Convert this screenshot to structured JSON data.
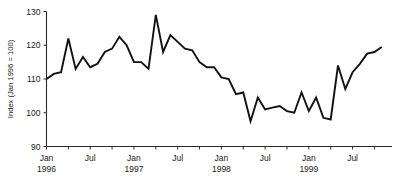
{
  "chart_data": {
    "type": "line",
    "title": "",
    "subtitle": "",
    "xlabel": "",
    "ylabel": "Index (Jan 1996 = 100)",
    "ylim": [
      90,
      130
    ],
    "ytick_values": [
      90,
      100,
      110,
      120,
      130
    ],
    "ytick_labels": [
      "90",
      "100",
      "110",
      "120",
      "130"
    ],
    "grid": false,
    "legend": null,
    "legend_position": "none",
    "x_axis_type": "monthly-time-series",
    "x_range": [
      "1996-01",
      "1999-11"
    ],
    "xtick_labels": [
      {
        "month": "Jan",
        "year": "1996"
      },
      {
        "month": "Jul",
        "year": ""
      },
      {
        "month": "Jan",
        "year": "1997"
      },
      {
        "month": "Jul",
        "year": ""
      },
      {
        "month": "Jan",
        "year": "1998"
      },
      {
        "month": "Jul",
        "year": ""
      },
      {
        "month": "Jan",
        "year": "1999"
      },
      {
        "month": "Jul",
        "year": ""
      }
    ],
    "minor_tick_interval_months": 3,
    "x": [
      "1996-01",
      "1996-02",
      "1996-03",
      "1996-04",
      "1996-05",
      "1996-06",
      "1996-07",
      "1996-08",
      "1996-09",
      "1996-10",
      "1996-11",
      "1996-12",
      "1997-01",
      "1997-02",
      "1997-03",
      "1997-04",
      "1997-05",
      "1997-06",
      "1997-07",
      "1997-08",
      "1997-09",
      "1997-10",
      "1997-11",
      "1997-12",
      "1998-01",
      "1998-02",
      "1998-03",
      "1998-04",
      "1998-05",
      "1998-06",
      "1998-07",
      "1998-08",
      "1998-09",
      "1998-10",
      "1998-11",
      "1998-12",
      "1999-01",
      "1999-02",
      "1999-03",
      "1999-04",
      "1999-05",
      "1999-06",
      "1999-07",
      "1999-08",
      "1999-09",
      "1999-10",
      "1999-11"
    ],
    "values": [
      110.0,
      111.5,
      112.0,
      122.0,
      113.0,
      116.5,
      113.5,
      114.5,
      118.0,
      119.0,
      122.5,
      120.0,
      115.0,
      115.0,
      113.0,
      129.0,
      118.0,
      123.0,
      121.0,
      119.0,
      118.5,
      115.0,
      113.5,
      113.5,
      110.5,
      110.0,
      105.5,
      106.0,
      97.5,
      104.5,
      101.0,
      101.5,
      102.0,
      100.5,
      100.0,
      106.0,
      100.5,
      104.5,
      98.5,
      98.0,
      114.0,
      107.0,
      112.0,
      114.5,
      117.5,
      118.0,
      119.5
    ],
    "series": [
      {
        "name": "Index (Jan 1996 = 100)",
        "color": "#111111",
        "values": [
          110.0,
          111.5,
          112.0,
          122.0,
          113.0,
          116.5,
          113.5,
          114.5,
          118.0,
          119.0,
          122.5,
          120.0,
          115.0,
          115.0,
          113.0,
          129.0,
          118.0,
          123.0,
          121.0,
          119.0,
          118.5,
          115.0,
          113.5,
          113.5,
          110.5,
          110.0,
          105.5,
          106.0,
          97.5,
          104.5,
          101.0,
          101.5,
          102.0,
          100.5,
          100.0,
          106.0,
          100.5,
          104.5,
          98.5,
          98.0,
          114.0,
          107.0,
          112.0,
          114.5,
          117.5,
          118.0,
          119.5
        ]
      }
    ],
    "annotations": []
  },
  "axes": {
    "y_title": "Index (Jan 1996 = 100)",
    "y_ticks": [
      "130",
      "120",
      "110",
      "100",
      "90"
    ],
    "x_ticks": [
      {
        "top": "Jan",
        "bottom": "1996"
      },
      {
        "top": "Jul",
        "bottom": ""
      },
      {
        "top": "Jan",
        "bottom": "1997"
      },
      {
        "top": "Jul",
        "bottom": ""
      },
      {
        "top": "Jan",
        "bottom": "1998"
      },
      {
        "top": "Jul",
        "bottom": ""
      },
      {
        "top": "Jan",
        "bottom": "1999"
      },
      {
        "top": "Jul",
        "bottom": ""
      }
    ]
  },
  "colors": {
    "line": "#111111",
    "axis": "#2b2b2b",
    "text": "#1a1a1a",
    "background": "#ffffff"
  }
}
